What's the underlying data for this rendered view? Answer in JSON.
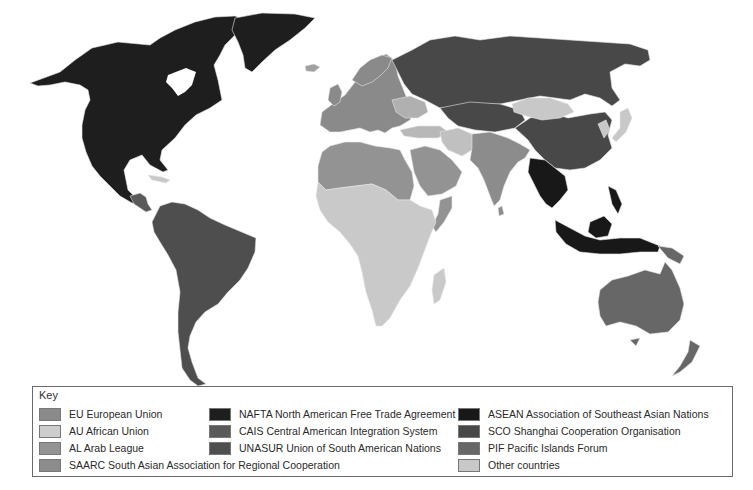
{
  "map": {
    "title": "World regional trade and cooperation organisations",
    "regions": {
      "nafta": {
        "fill": "#1e1e1e",
        "members": [
          "Canada",
          "USA",
          "Mexico",
          "Greenland (shown)"
        ]
      },
      "cais": {
        "fill": "#5a5a5a",
        "members": [
          "Central America"
        ]
      },
      "unasur": {
        "fill": "#4e4e4e",
        "members": [
          "South America"
        ]
      },
      "eu": {
        "fill": "#8a8a8a",
        "members": [
          "Europe"
        ]
      },
      "au": {
        "fill": "#c9c9c9",
        "members": [
          "Sub-Saharan Africa"
        ]
      },
      "al": {
        "fill": "#939393",
        "members": [
          "North Africa",
          "Arabian Peninsula"
        ]
      },
      "saarc": {
        "fill": "#8c8c8c",
        "members": [
          "India",
          "Pakistan",
          "South Asia"
        ]
      },
      "asean": {
        "fill": "#181818",
        "members": [
          "Southeast Asia",
          "Indonesia"
        ]
      },
      "sco": {
        "fill": "#484848",
        "members": [
          "Russia",
          "China",
          "Central Asia"
        ]
      },
      "pif": {
        "fill": "#676767",
        "members": [
          "Australia",
          "New Zealand",
          "Papua New Guinea"
        ]
      },
      "other": {
        "fill": "#c8c8c8",
        "members": [
          "Mongolia",
          "Japan",
          "Korea",
          "Iran",
          "Turkey"
        ]
      }
    }
  },
  "key": {
    "title": "Key",
    "items": [
      {
        "id": "eu",
        "label": "EU European Union",
        "color": "#8a8a8a"
      },
      {
        "id": "au",
        "label": "AU African Union",
        "color": "#cdcdcd"
      },
      {
        "id": "al",
        "label": "AL Arab League",
        "color": "#939393"
      },
      {
        "id": "saarc",
        "label": "SAARC South Asian Association for Regional Cooperation",
        "color": "#8c8c8c"
      },
      {
        "id": "nafta",
        "label": "NAFTA North American Free Trade Agreement",
        "color": "#1e1e1e"
      },
      {
        "id": "cais",
        "label": "CAIS Central American Integration System",
        "color": "#5a5a5a"
      },
      {
        "id": "unasur",
        "label": "UNASUR Union of South American Nations",
        "color": "#4e4e4e"
      },
      {
        "id": "asean",
        "label": "ASEAN Association of Southeast Asian Nations",
        "color": "#181818"
      },
      {
        "id": "sco",
        "label": "SCO Shanghai Cooperation Organisation",
        "color": "#484848"
      },
      {
        "id": "pif",
        "label": "PIF Pacific Islands Forum",
        "color": "#676767"
      },
      {
        "id": "other",
        "label": "Other countries",
        "color": "#c8c8c8"
      }
    ]
  }
}
